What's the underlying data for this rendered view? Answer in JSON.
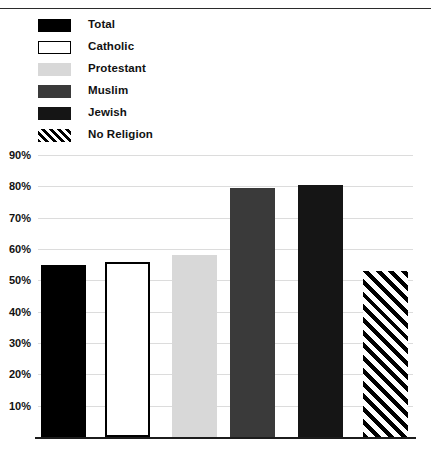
{
  "chart_data": {
    "type": "bar",
    "title": "",
    "subtitle": "",
    "xlabel": "",
    "ylabel": "",
    "categories": [
      "Total",
      "Catholic",
      "Protestant",
      "Muslim",
      "Jewish",
      "No Religion"
    ],
    "values": [
      55,
      56,
      58,
      79.5,
      80.5,
      53
    ],
    "value_format": "percent",
    "ylim": [
      0,
      90
    ],
    "ytick_values": [
      90,
      80,
      70,
      60,
      50,
      40,
      30,
      20,
      10
    ],
    "ytick_labels": [
      "90%",
      "80%",
      "70%",
      "60%",
      "50%",
      "40%",
      "30%",
      "20%",
      "10%"
    ],
    "grid": true,
    "grid_axis": "y",
    "legend_position": "top-left",
    "series": [
      {
        "name": "",
        "points": [
          {
            "category": "Total",
            "value": 55,
            "fill": "solid-black",
            "color": "#000000"
          },
          {
            "category": "Catholic",
            "value": 56,
            "fill": "outline",
            "color": "#ffffff"
          },
          {
            "category": "Protestant",
            "value": 58,
            "fill": "light-gray",
            "color": "#d8d8d8"
          },
          {
            "category": "Muslim",
            "value": 79.5,
            "fill": "dark-gray",
            "color": "#3a3a3a"
          },
          {
            "category": "Jewish",
            "value": 80.5,
            "fill": "near-black",
            "color": "#151515"
          },
          {
            "category": "No Religion",
            "value": 53,
            "fill": "hatch",
            "color": "#000000"
          }
        ]
      }
    ]
  },
  "legend": {
    "items": [
      {
        "label": "Total",
        "swatch": "solid-black-swatch"
      },
      {
        "label": "Catholic",
        "swatch": "outline-swatch"
      },
      {
        "label": "Protestant",
        "swatch": "light-gray-swatch"
      },
      {
        "label": "Muslim",
        "swatch": "dark-gray-swatch"
      },
      {
        "label": "Jewish",
        "swatch": "near-black-swatch"
      },
      {
        "label": "No Religion",
        "swatch": "diagonal-hatch-swatch"
      }
    ]
  },
  "axis": {
    "y": {
      "ticks": [
        {
          "label": "90%",
          "value": 90
        },
        {
          "label": "80%",
          "value": 80
        },
        {
          "label": "70%",
          "value": 70
        },
        {
          "label": "60%",
          "value": 60
        },
        {
          "label": "50%",
          "value": 50
        },
        {
          "label": "40%",
          "value": 40
        },
        {
          "label": "30%",
          "value": 30
        },
        {
          "label": "20%",
          "value": 20
        },
        {
          "label": "10%",
          "value": 10
        }
      ]
    }
  },
  "colors": {
    "total": "#000000",
    "catholic": "#ffffff",
    "protestant": "#d8d8d8",
    "muslim": "#3a3a3a",
    "jewish": "#151515",
    "no_religion": "#000000",
    "gridline": "#dcdcdc",
    "axis": "#1c1c1c",
    "text": "#111111"
  }
}
